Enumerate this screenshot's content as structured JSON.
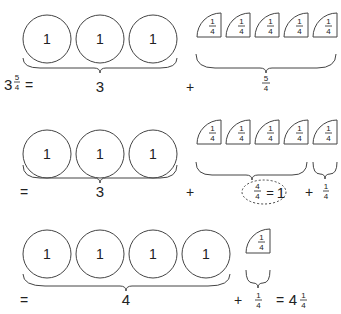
{
  "row1": {
    "lhs": {
      "whole": "3",
      "num": "5",
      "den": "4",
      "eq": "="
    },
    "circles": [
      "1",
      "1",
      "1"
    ],
    "circles_total": "3",
    "plus": "+",
    "quarters": [
      {
        "num": "1",
        "den": "4"
      },
      {
        "num": "1",
        "den": "4"
      },
      {
        "num": "1",
        "den": "4"
      },
      {
        "num": "1",
        "den": "4"
      },
      {
        "num": "1",
        "den": "4"
      }
    ],
    "quarters_total": {
      "num": "5",
      "den": "4"
    }
  },
  "row2": {
    "eq": "=",
    "circles": [
      "1",
      "1",
      "1"
    ],
    "circles_total": "3",
    "plus": "+",
    "quarters_group": [
      {
        "num": "1",
        "den": "4"
      },
      {
        "num": "1",
        "den": "4"
      },
      {
        "num": "1",
        "den": "4"
      },
      {
        "num": "1",
        "den": "4"
      }
    ],
    "group_total": {
      "num": "4",
      "den": "4",
      "eq": "=",
      "value": "1"
    },
    "plus2": "+",
    "quarter_extra": {
      "num": "1",
      "den": "4"
    },
    "extra_total": {
      "num": "1",
      "den": "4"
    }
  },
  "row3": {
    "eq": "=",
    "circles": [
      "1",
      "1",
      "1",
      "1"
    ],
    "circles_total": "4",
    "plus": "+",
    "quarter_extra": {
      "num": "1",
      "den": "4"
    },
    "extra_total": {
      "num": "1",
      "den": "4"
    },
    "eq2": "=",
    "result": {
      "whole": "4",
      "num": "1",
      "den": "4"
    }
  }
}
